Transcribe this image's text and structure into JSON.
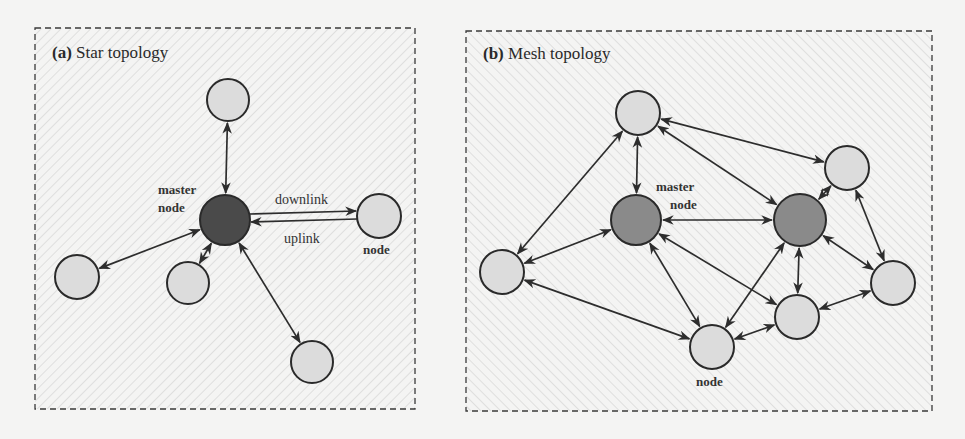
{
  "colors": {
    "background": "#f4f4f3",
    "hatch": "#cccccc",
    "node_fill": "#dcdcdc",
    "star_master_fill": "#4a4a4a",
    "mesh_master_fill": "#8a8a8a",
    "stroke": "#2a2a2a"
  },
  "panels": [
    {
      "id": "a",
      "prefix": "(a)",
      "title": "Star topology",
      "hatch_direction": "backslash",
      "master_label_line1": "master",
      "master_label_line2": "node",
      "node_label": "node",
      "downlink_label": "downlink",
      "uplink_label": "uplink",
      "nodes": [
        {
          "id": "master",
          "x": 225,
          "y": 220,
          "r": 25,
          "type": "master"
        },
        {
          "id": "top",
          "x": 228,
          "y": 100,
          "r": 21,
          "type": "node"
        },
        {
          "id": "right",
          "x": 379,
          "y": 216,
          "r": 22,
          "type": "node"
        },
        {
          "id": "left",
          "x": 77,
          "y": 277,
          "r": 22,
          "type": "node"
        },
        {
          "id": "lowmid",
          "x": 188,
          "y": 283,
          "r": 21,
          "type": "node"
        },
        {
          "id": "bottom",
          "x": 312,
          "y": 362,
          "r": 21,
          "type": "node"
        }
      ],
      "edges": [
        [
          "master",
          "top"
        ],
        [
          "master",
          "left"
        ],
        [
          "master",
          "lowmid"
        ],
        [
          "master",
          "bottom"
        ]
      ]
    },
    {
      "id": "b",
      "prefix": "(b)",
      "title": "Mesh topology",
      "hatch_direction": "slash",
      "master_label_line1": "master",
      "master_label_line2": "node",
      "node_label": "node",
      "nodes": [
        {
          "id": "m1",
          "x": 636,
          "y": 220,
          "r": 25,
          "type": "master"
        },
        {
          "id": "m2",
          "x": 800,
          "y": 220,
          "r": 26,
          "type": "master"
        },
        {
          "id": "top",
          "x": 638,
          "y": 113,
          "r": 22,
          "type": "node"
        },
        {
          "id": "topright",
          "x": 847,
          "y": 168,
          "r": 22,
          "type": "node"
        },
        {
          "id": "left",
          "x": 502,
          "y": 272,
          "r": 22,
          "type": "node"
        },
        {
          "id": "right",
          "x": 893,
          "y": 283,
          "r": 22,
          "type": "node"
        },
        {
          "id": "midlow",
          "x": 797,
          "y": 317,
          "r": 22,
          "type": "node"
        },
        {
          "id": "bottom",
          "x": 712,
          "y": 347,
          "r": 22,
          "type": "node"
        }
      ],
      "edges": [
        [
          "top",
          "m1"
        ],
        [
          "top",
          "left"
        ],
        [
          "top",
          "topright"
        ],
        [
          "top",
          "m2"
        ],
        [
          "m1",
          "m2"
        ],
        [
          "m1",
          "left"
        ],
        [
          "m1",
          "bottom"
        ],
        [
          "m1",
          "midlow"
        ],
        [
          "m2",
          "topright"
        ],
        [
          "m2",
          "midlow"
        ],
        [
          "m2",
          "right"
        ],
        [
          "m2",
          "bottom"
        ],
        [
          "topright",
          "right"
        ],
        [
          "right",
          "midlow"
        ],
        [
          "midlow",
          "bottom"
        ],
        [
          "left",
          "bottom"
        ]
      ]
    }
  ]
}
